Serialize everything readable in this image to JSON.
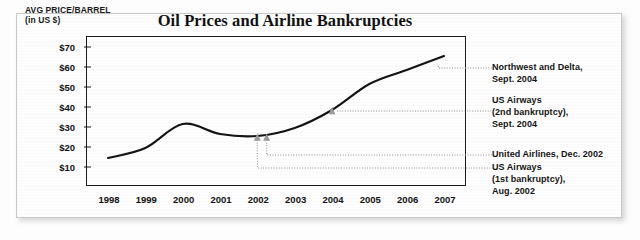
{
  "chart_data": {
    "type": "line",
    "title": "Oil Prices and Airline Bankruptcies",
    "ylabel_line1": "AVG PRICE/BARREL",
    "ylabel_line2": "(in US $)",
    "xlabel": "",
    "grid": false,
    "legend": "none",
    "xlim": [
      1998,
      2007
    ],
    "ylim": [
      0,
      75
    ],
    "categories": [
      "1998",
      "1999",
      "2000",
      "2001",
      "2002",
      "2003",
      "2004",
      "2005",
      "2006",
      "2007"
    ],
    "x": [
      1998,
      1999,
      2000,
      2001,
      2002,
      2003,
      2004,
      2005,
      2006,
      2007
    ],
    "values": [
      14,
      19,
      31,
      26,
      25,
      29,
      38,
      51,
      58,
      65
    ],
    "ytick_values": [
      10,
      20,
      30,
      40,
      50,
      60,
      70
    ],
    "ytick_labels": [
      "$10",
      "$20",
      "$30",
      "$40",
      "$50",
      "$60",
      "$70"
    ],
    "series": [
      {
        "name": "Average price per barrel (US $)",
        "values": [
          14,
          19,
          31,
          26,
          25,
          29,
          38,
          51,
          58,
          65
        ]
      }
    ],
    "markers": [
      {
        "name": "us-airways-first-bankruptcy",
        "x": 2002.0,
        "y": 24.2
      },
      {
        "name": "united-airlines",
        "x": 2002.25,
        "y": 24.2
      },
      {
        "name": "us-airways-second-bankruptcy",
        "x": 2004.0,
        "y": 37.5
      },
      {
        "name": "northwest-and-delta",
        "x": 2006.85,
        "y": 60.0
      }
    ],
    "annotations": [
      {
        "id": "northwest-delta",
        "text": "Northwest and Delta,\nSept. 2004",
        "event_year": "Sept. 2004",
        "airlines": "Northwest and Delta"
      },
      {
        "id": "us-airways-2nd",
        "text": "US Airways\n(2nd bankruptcy),\nSept. 2004",
        "event_year": "Sept. 2004",
        "airlines": "US Airways"
      },
      {
        "id": "united-airlines",
        "text": "United Airlines, Dec. 2002",
        "event_year": "Dec. 2002",
        "airlines": "United Airlines"
      },
      {
        "id": "us-airways-1st",
        "text": "US Airways\n(1st bankruptcy),\nAug. 2002",
        "event_year": "Aug. 2002",
        "airlines": "US Airways"
      }
    ],
    "colors": {
      "line": "#141414",
      "marker": "#9a9a9a",
      "leader": "#8d8d8d",
      "axis": "#1a1a1a",
      "text": "#141414",
      "card": "#ffffff"
    }
  }
}
